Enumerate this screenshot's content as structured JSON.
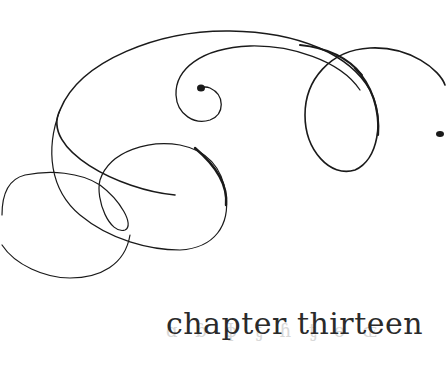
{
  "chapter": {
    "heading": "chapter thirteen"
  },
  "decoration": {
    "icon": "flourish-ornament",
    "stroke_color": "#1a1a1a"
  }
}
